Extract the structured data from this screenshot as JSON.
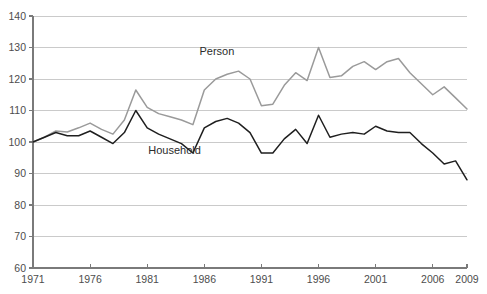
{
  "chart_data": {
    "type": "line",
    "title": "",
    "subtitle": "",
    "xlabel": "",
    "ylabel": "",
    "xlim": [
      1971,
      2009
    ],
    "ylim": [
      60,
      140
    ],
    "grid": true,
    "legend_position": "inline-annotation",
    "y_ticks": [
      60,
      70,
      80,
      90,
      100,
      110,
      120,
      130,
      140
    ],
    "x_ticks": [
      1971,
      1976,
      1981,
      1986,
      1991,
      1996,
      2001,
      2006,
      2009
    ],
    "x": [
      1971,
      1972,
      1973,
      1974,
      1975,
      1976,
      1977,
      1978,
      1979,
      1980,
      1981,
      1982,
      1983,
      1984,
      1985,
      1986,
      1987,
      1988,
      1989,
      1990,
      1991,
      1992,
      1993,
      1994,
      1995,
      1996,
      1997,
      1998,
      1999,
      2000,
      2001,
      2002,
      2003,
      2004,
      2005,
      2006,
      2007,
      2008,
      2009
    ],
    "series": [
      {
        "name": "Person",
        "color": "#9a9a9a",
        "values": [
          100.0,
          101.5,
          103.5,
          103.2,
          104.5,
          106.0,
          104.0,
          102.5,
          107.0,
          116.5,
          111.0,
          109.0,
          108.0,
          107.0,
          105.5,
          116.5,
          120.0,
          121.5,
          122.5,
          120.0,
          111.5,
          112.0,
          118.0,
          122.0,
          119.5,
          130.0,
          120.5,
          121.0,
          124.0,
          125.5,
          123.0,
          125.5,
          126.5,
          122.0,
          118.5,
          115.0,
          117.5,
          114.0,
          110.5
        ]
      },
      {
        "name": "Household",
        "color": "#1f1f1f",
        "values": [
          100.0,
          101.5,
          103.0,
          102.0,
          102.0,
          103.5,
          101.5,
          99.5,
          103.0,
          110.0,
          104.5,
          102.5,
          101.0,
          99.5,
          96.5,
          104.5,
          106.5,
          107.5,
          106.0,
          103.0,
          96.5,
          96.5,
          101.0,
          104.0,
          99.5,
          108.5,
          101.5,
          102.5,
          103.0,
          102.5,
          105.0,
          103.5,
          103.0,
          103.0,
          99.5,
          96.5,
          93.0,
          94.0,
          88.0
        ]
      }
    ],
    "annotations": [
      {
        "text": "Person",
        "x": 1987.1,
        "y": 127.6
      },
      {
        "text": "Household",
        "x": 1983.4,
        "y": 96.3
      }
    ]
  }
}
